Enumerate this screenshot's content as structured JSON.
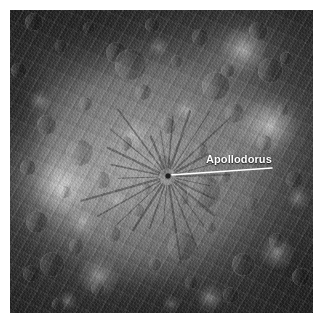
{
  "figure": {
    "kind": "planetary-surface-photo",
    "width": 325,
    "height": 328,
    "palette": {
      "page_background": "#ffffff",
      "surface_mid": "#7d7d7d",
      "surface_dark": "#3a3a3a",
      "surface_bright": "#e8e8e8",
      "annotation": "#ffffff"
    }
  },
  "annotations": {
    "apollodorus": {
      "label": "Apollodorus",
      "leader_line_color": "#ffffff",
      "leader_from": {
        "x": 160,
        "y": 165
      },
      "leader_to": {
        "x": 262,
        "y": 158
      },
      "target": {
        "x": 158,
        "y": 166
      }
    }
  },
  "craters": [
    {
      "cx": 8,
      "cy": 4,
      "r": 3.0,
      "depth": 0.3
    },
    {
      "cx": 17,
      "cy": 12,
      "r": 2.2,
      "depth": 0.26
    },
    {
      "cx": 3,
      "cy": 20,
      "r": 2.6,
      "depth": 0.28
    },
    {
      "cx": 26,
      "cy": 6,
      "r": 2.0,
      "depth": 0.22
    },
    {
      "cx": 35,
      "cy": 14,
      "r": 3.4,
      "depth": 0.3
    },
    {
      "cx": 47,
      "cy": 5,
      "r": 2.4,
      "depth": 0.24
    },
    {
      "cx": 55,
      "cy": 17,
      "r": 2.0,
      "depth": 0.22
    },
    {
      "cx": 63,
      "cy": 9,
      "r": 2.8,
      "depth": 0.26
    },
    {
      "cx": 72,
      "cy": 20,
      "r": 2.2,
      "depth": 0.24
    },
    {
      "cx": 82,
      "cy": 7,
      "r": 3.0,
      "depth": 0.28
    },
    {
      "cx": 91,
      "cy": 16,
      "r": 2.0,
      "depth": 0.22
    },
    {
      "cx": 44,
      "cy": 27,
      "r": 2.6,
      "depth": 0.26
    },
    {
      "cx": 25,
      "cy": 31,
      "r": 2.2,
      "depth": 0.24
    },
    {
      "cx": 12,
      "cy": 38,
      "r": 3.2,
      "depth": 0.28
    },
    {
      "cx": 6,
      "cy": 52,
      "r": 2.6,
      "depth": 0.26
    },
    {
      "cx": 18,
      "cy": 60,
      "r": 2.0,
      "depth": 0.22
    },
    {
      "cx": 9,
      "cy": 70,
      "r": 3.6,
      "depth": 0.3
    },
    {
      "cx": 22,
      "cy": 78,
      "r": 2.4,
      "depth": 0.24
    },
    {
      "cx": 7,
      "cy": 87,
      "r": 2.8,
      "depth": 0.26
    },
    {
      "cx": 29,
      "cy": 92,
      "r": 2.2,
      "depth": 0.22
    },
    {
      "cx": 16,
      "cy": 97,
      "r": 2.0,
      "depth": 0.22
    },
    {
      "cx": 38,
      "cy": 44,
      "r": 2.4,
      "depth": 0.24
    },
    {
      "cx": 30,
      "cy": 56,
      "r": 3.0,
      "depth": 0.22
    },
    {
      "cx": 42,
      "cy": 66,
      "r": 2.2,
      "depth": 0.2
    },
    {
      "cx": 34,
      "cy": 74,
      "r": 2.6,
      "depth": 0.22
    },
    {
      "cx": 48,
      "cy": 84,
      "r": 2.0,
      "depth": 0.2
    },
    {
      "cx": 57,
      "cy": 62,
      "r": 2.4,
      "depth": 0.2
    },
    {
      "cx": 66,
      "cy": 72,
      "r": 2.0,
      "depth": 0.2
    },
    {
      "cx": 52,
      "cy": 38,
      "r": 2.8,
      "depth": 0.24
    },
    {
      "cx": 63,
      "cy": 46,
      "r": 2.2,
      "depth": 0.22
    },
    {
      "cx": 74,
      "cy": 34,
      "r": 3.2,
      "depth": 0.26
    },
    {
      "cx": 71,
      "cy": 55,
      "r": 2.0,
      "depth": 0.2
    },
    {
      "cx": 84,
      "cy": 44,
      "r": 2.6,
      "depth": 0.24
    },
    {
      "cx": 80,
      "cy": 64,
      "r": 2.2,
      "depth": 0.2
    },
    {
      "cx": 90,
      "cy": 33,
      "r": 2.0,
      "depth": 0.22
    },
    {
      "cx": 94,
      "cy": 56,
      "r": 2.8,
      "depth": 0.24
    },
    {
      "cx": 88,
      "cy": 76,
      "r": 2.4,
      "depth": 0.22
    },
    {
      "cx": 96,
      "cy": 88,
      "r": 3.0,
      "depth": 0.26
    },
    {
      "cx": 60,
      "cy": 90,
      "r": 2.2,
      "depth": 0.22
    },
    {
      "cx": 73,
      "cy": 94,
      "r": 2.6,
      "depth": 0.24
    },
    {
      "cx": 40,
      "cy": 18,
      "r": 5.2,
      "depth": 0.24
    },
    {
      "cx": 23,
      "cy": 47,
      "r": 4.4,
      "depth": 0.2
    },
    {
      "cx": 68,
      "cy": 25,
      "r": 4.6,
      "depth": 0.26
    },
    {
      "cx": 86,
      "cy": 20,
      "r": 4.0,
      "depth": 0.24
    },
    {
      "cx": 57,
      "cy": 78,
      "r": 4.8,
      "depth": 0.22
    },
    {
      "cx": 14,
      "cy": 84,
      "r": 4.2,
      "depth": 0.22
    },
    {
      "cx": 77,
      "cy": 84,
      "r": 3.8,
      "depth": 0.22
    },
    {
      "cx": 50,
      "cy": 51,
      "r": 3.6,
      "depth": 0.18
    },
    {
      "cx": 64,
      "cy": 60,
      "r": 5.6,
      "depth": 0.2
    },
    {
      "cx": 45,
      "cy": 59,
      "r": 2.0,
      "depth": 0.18
    }
  ],
  "bright_spots": [
    {
      "cx": 17,
      "cy": 58,
      "r": 10.0,
      "intensity": 0.55
    },
    {
      "cx": 86,
      "cy": 38,
      "r": 9.0,
      "intensity": 0.52
    },
    {
      "cx": 77,
      "cy": 13,
      "r": 8.0,
      "intensity": 0.5
    },
    {
      "cx": 29,
      "cy": 88,
      "r": 7.0,
      "intensity": 0.45
    },
    {
      "cx": 88,
      "cy": 80,
      "r": 6.0,
      "intensity": 0.42
    },
    {
      "cx": 41,
      "cy": 41,
      "r": 5.0,
      "intensity": 0.4
    },
    {
      "cx": 58,
      "cy": 33,
      "r": 4.0,
      "intensity": 0.36
    },
    {
      "cx": 24,
      "cy": 70,
      "r": 4.5,
      "intensity": 0.38
    },
    {
      "cx": 66,
      "cy": 95,
      "r": 5.0,
      "intensity": 0.4
    },
    {
      "cx": 10,
      "cy": 30,
      "r": 4.0,
      "intensity": 0.32
    },
    {
      "cx": 95,
      "cy": 62,
      "r": 4.0,
      "intensity": 0.34
    },
    {
      "cx": 49,
      "cy": 12,
      "r": 3.5,
      "intensity": 0.3
    },
    {
      "cx": 35,
      "cy": 63,
      "r": 3.5,
      "intensity": 0.3
    },
    {
      "cx": 72,
      "cy": 48,
      "r": 3.0,
      "intensity": 0.28
    },
    {
      "cx": 19,
      "cy": 96,
      "r": 3.5,
      "intensity": 0.3
    },
    {
      "cx": 53,
      "cy": 97,
      "r": 3.0,
      "intensity": 0.28
    }
  ],
  "fossae": {
    "center": {
      "x": 52,
      "y": 55
    },
    "ray_count": 26,
    "inner_radius": 3,
    "outer_radius": 26,
    "color": "#3c3c3c"
  }
}
